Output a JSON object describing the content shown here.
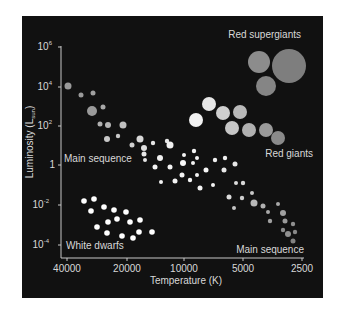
{
  "chart_data": {
    "type": "scatter",
    "xlabel": "Temperature (K)",
    "ylabel": "Luminosity (L☉)",
    "x_scale": "log, reversed",
    "y_scale": "log",
    "xlim": [
      40000,
      2500
    ],
    "ylim": [
      0.0001,
      1000000
    ],
    "x_ticks": [
      "40000",
      "20000",
      "10000",
      "5000",
      "2500"
    ],
    "y_ticks": [
      "10^6",
      "10^4",
      "10^2",
      "1",
      "10^-2",
      "10^-4"
    ],
    "grid": false,
    "background": "#111111",
    "annotations": [
      "Red supergiants",
      "Red giants",
      "Main sequence",
      "Main sequence",
      "White dwarfs"
    ],
    "series": [
      {
        "name": "Red supergiants",
        "approx_temperature_K": [
          5000,
          3200,
          4200
        ],
        "approx_luminosity": [
          30000,
          20000,
          3000
        ],
        "color": "#8a8a8a"
      },
      {
        "name": "Red giants",
        "approx_temperature_K": [
          9000,
          7500,
          6500,
          5500,
          6000,
          5000,
          4300,
          3800
        ],
        "approx_luminosity": [
          100,
          300,
          150,
          200,
          40,
          40,
          40,
          15
        ],
        "color": "#bdbdbd"
      },
      {
        "name": "Main sequence",
        "approx_temperature_K": [
          40000,
          30000,
          25000,
          15000,
          10000,
          7000,
          5000,
          3500,
          2800
        ],
        "approx_luminosity": [
          10000,
          1000,
          100,
          30,
          3,
          0.5,
          0.05,
          0.005,
          0.0005
        ],
        "color": "#e0e0e0"
      },
      {
        "name": "White dwarfs",
        "approx_temperature_K": [
          35000,
          30000,
          25000,
          20000,
          15000
        ],
        "approx_luminosity": [
          0.01,
          0.005,
          0.002,
          0.001,
          0.0005
        ],
        "color": "#ffffff"
      }
    ]
  },
  "labels": {
    "red_supergiants": "Red supergiants",
    "red_giants": "Red giants",
    "main_sequence_upper": "Main sequence",
    "main_sequence_lower": "Main sequence",
    "white_dwarfs": "White dwarfs",
    "xlabel": "Temperature (K)",
    "ylabel": "Luminosity (L",
    "ylabel_sub": "sun",
    "ylabel_close": ")"
  },
  "x_ticks": [
    {
      "label": "40000",
      "x": 67
    },
    {
      "label": "20000",
      "x": 127
    },
    {
      "label": "10000",
      "x": 184
    },
    {
      "label": "5000",
      "x": 243
    },
    {
      "label": "2500",
      "x": 302
    }
  ],
  "y_ticks": [
    {
      "base": "10",
      "exp": "6",
      "y": 47
    },
    {
      "base": "10",
      "exp": "4",
      "y": 87
    },
    {
      "base": "10",
      "exp": "2",
      "y": 126
    },
    {
      "base": "1",
      "exp": "",
      "y": 165
    },
    {
      "base": "10",
      "exp": "-2",
      "y": 205
    },
    {
      "base": "10",
      "exp": "-4",
      "y": 245
    }
  ],
  "stars": {
    "supergiants": [
      [
        259,
        62,
        11,
        "#8c8c8c"
      ],
      [
        289,
        66,
        17,
        "#7e7e7e"
      ],
      [
        266,
        86,
        10,
        "#858585"
      ]
    ],
    "giants": [
      [
        196,
        120,
        7,
        "#f2f2f2"
      ],
      [
        209,
        104,
        7,
        "#e6e6e6"
      ],
      [
        223,
        113,
        7,
        "#cfcfcf"
      ],
      [
        240,
        112,
        7,
        "#b9b9b9"
      ],
      [
        232,
        128,
        7,
        "#c6c6c6"
      ],
      [
        249,
        130,
        7,
        "#b0b0b0"
      ],
      [
        266,
        130,
        7,
        "#9a9a9a"
      ],
      [
        278,
        138,
        7,
        "#8a8a8a"
      ]
    ],
    "main_sequence": [
      [
        68,
        86,
        3.5,
        "#9a9a9a"
      ],
      [
        81,
        95,
        2.5,
        "#9a9a9a"
      ],
      [
        93,
        93,
        2.5,
        "#a0a0a0"
      ],
      [
        92,
        111,
        5,
        "#9a9a9a"
      ],
      [
        103,
        107,
        2.5,
        "#a8a8a8"
      ],
      [
        100,
        124,
        2.5,
        "#b0b0b0"
      ],
      [
        108,
        125,
        3,
        "#b5b5b5"
      ],
      [
        123,
        125,
        3.5,
        "#c0c0c0"
      ],
      [
        107,
        139,
        3,
        "#c8c8c8"
      ],
      [
        118,
        136,
        2.2,
        "#c8c8c8"
      ],
      [
        140,
        139,
        3.5,
        "#d8d8d8"
      ],
      [
        132,
        145,
        2.5,
        "#d0d0d0"
      ],
      [
        144,
        148,
        3,
        "#e0e0e0"
      ],
      [
        153,
        143,
        2.2,
        "#e6e6e6"
      ],
      [
        167,
        141,
        2.2,
        "#e6e6e6"
      ],
      [
        160,
        158,
        3,
        "#f0f0f0"
      ],
      [
        170,
        145,
        3.5,
        "#f0f0f0"
      ],
      [
        145,
        160,
        2,
        "#e6e6e6"
      ],
      [
        155,
        167,
        2.5,
        "#f4f4f4"
      ],
      [
        144,
        154,
        2.5,
        "#e8e8e8"
      ],
      [
        170,
        167,
        2.5,
        "#f4f4f4"
      ],
      [
        183,
        163,
        3,
        "#f8f8f8"
      ],
      [
        193,
        163,
        2,
        "#f4f4f4"
      ],
      [
        184,
        155,
        2,
        "#f4f4f4"
      ],
      [
        194,
        151,
        2.2,
        "#f4f4f4"
      ],
      [
        197,
        158,
        2,
        "#f4f4f4"
      ],
      [
        206,
        170,
        2.5,
        "#f8f8f8"
      ],
      [
        182,
        175,
        2.5,
        "#f4f4f4"
      ],
      [
        197,
        175,
        2,
        "#f4f4f4"
      ],
      [
        161,
        182,
        2,
        "#f4f4f4"
      ],
      [
        175,
        181,
        2.5,
        "#f4f4f4"
      ],
      [
        190,
        180,
        2.2,
        "#f4f4f4"
      ],
      [
        200,
        188,
        2.5,
        "#f4f4f4"
      ],
      [
        213,
        185,
        2,
        "#f4f4f4"
      ],
      [
        225,
        158,
        2.2,
        "#f0f0f0"
      ],
      [
        235,
        164,
        2.5,
        "#e6e6e6"
      ],
      [
        215,
        160,
        2.2,
        "#f0f0f0"
      ],
      [
        224,
        170,
        2.5,
        "#e8e8e8"
      ],
      [
        243,
        183,
        2.2,
        "#d8d8d8"
      ],
      [
        236,
        183,
        2,
        "#dcdcdc"
      ],
      [
        229,
        197,
        2.5,
        "#dcdcdc"
      ],
      [
        242,
        198,
        2.2,
        "#cdcdcd"
      ],
      [
        252,
        193,
        2,
        "#c8c8c8"
      ],
      [
        234,
        208,
        2,
        "#c4c4c4"
      ],
      [
        254,
        203,
        3.5,
        "#b8b8b8"
      ],
      [
        263,
        206,
        2.5,
        "#b0b0b0"
      ],
      [
        268,
        212,
        2,
        "#a8a8a8"
      ],
      [
        278,
        204,
        2,
        "#a8a8a8"
      ],
      [
        283,
        213,
        3,
        "#a0a0a0"
      ],
      [
        270,
        221,
        2.2,
        "#a0a0a0"
      ],
      [
        285,
        221,
        2.5,
        "#9a9a9a"
      ],
      [
        293,
        224,
        2.2,
        "#909090"
      ],
      [
        283,
        230,
        2.2,
        "#8c8c8c"
      ],
      [
        288,
        234,
        3,
        "#909090"
      ],
      [
        295,
        232,
        2.2,
        "#888888"
      ],
      [
        293,
        241,
        2.5,
        "#828282"
      ]
    ],
    "white_dwarfs": [
      [
        84,
        201,
        2.8
      ],
      [
        94,
        199,
        2.8
      ],
      [
        91,
        211,
        2.8
      ],
      [
        104,
        207,
        2.8
      ],
      [
        114,
        210,
        2.8
      ],
      [
        126,
        212,
        2.8
      ],
      [
        97,
        227,
        2.8
      ],
      [
        108,
        222,
        2.8
      ],
      [
        117,
        219,
        2.8
      ],
      [
        130,
        222,
        2.8
      ],
      [
        140,
        220,
        2.8
      ],
      [
        107,
        233,
        2.8
      ],
      [
        122,
        236,
        2.8
      ],
      [
        133,
        238,
        2.8
      ],
      [
        139,
        232,
        2.8
      ],
      [
        152,
        232,
        2.8
      ]
    ]
  }
}
